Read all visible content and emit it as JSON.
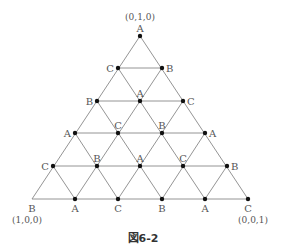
{
  "figure": {
    "caption": "図6-2",
    "line_color": "#888888",
    "dot_color": "#111111"
  },
  "vertices": {
    "top": {
      "label": "A",
      "coord": "(0,1,0)"
    },
    "bottom_left": {
      "label": "B",
      "coord": "(1,0,0)"
    },
    "bottom_right": {
      "label": "C",
      "coord": "(0,0,1)"
    }
  },
  "rows": [
    {
      "y": 36,
      "points": [
        {
          "x": 140,
          "label": "A",
          "pos": "above"
        }
      ]
    },
    {
      "y": 68,
      "points": [
        {
          "x": 118,
          "label": "C",
          "pos": "left"
        },
        {
          "x": 162,
          "label": "B",
          "pos": "right"
        }
      ]
    },
    {
      "y": 101,
      "points": [
        {
          "x": 97,
          "label": "B",
          "pos": "left"
        },
        {
          "x": 140,
          "label": "A",
          "pos": "above"
        },
        {
          "x": 183,
          "label": "C",
          "pos": "right"
        }
      ]
    },
    {
      "y": 133,
      "points": [
        {
          "x": 75,
          "label": "A",
          "pos": "left"
        },
        {
          "x": 118,
          "label": "C",
          "pos": "above"
        },
        {
          "x": 162,
          "label": "B",
          "pos": "above"
        },
        {
          "x": 205,
          "label": "A",
          "pos": "right"
        }
      ]
    },
    {
      "y": 166,
      "points": [
        {
          "x": 53,
          "label": "C",
          "pos": "left"
        },
        {
          "x": 97,
          "label": "B",
          "pos": "above"
        },
        {
          "x": 140,
          "label": "A",
          "pos": "above"
        },
        {
          "x": 183,
          "label": "C",
          "pos": "above"
        },
        {
          "x": 227,
          "label": "B",
          "pos": "right"
        }
      ]
    },
    {
      "y": 199,
      "points": [
        {
          "x": 32,
          "label": "B",
          "pos": "below",
          "nodot": true
        },
        {
          "x": 75,
          "label": "A",
          "pos": "below"
        },
        {
          "x": 118,
          "label": "C",
          "pos": "below"
        },
        {
          "x": 162,
          "label": "B",
          "pos": "below"
        },
        {
          "x": 205,
          "label": "A",
          "pos": "below"
        },
        {
          "x": 248,
          "label": "C",
          "pos": "below"
        }
      ]
    }
  ]
}
